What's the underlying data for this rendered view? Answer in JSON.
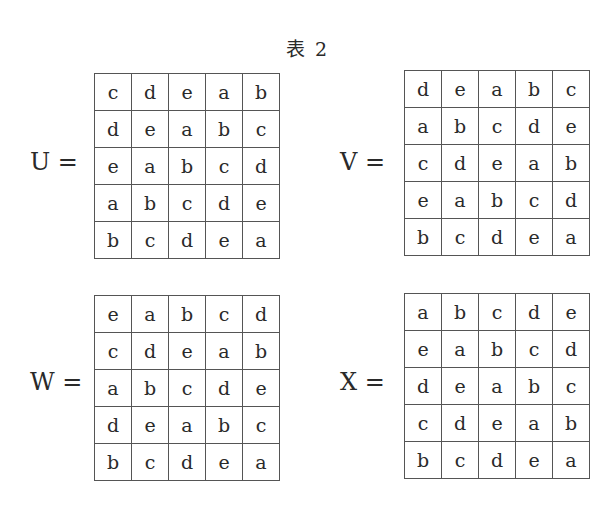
{
  "title": "表 2",
  "matrices": [
    {
      "name": "U",
      "label": "U =",
      "rows": [
        [
          "c",
          "d",
          "e",
          "a",
          "b"
        ],
        [
          "d",
          "e",
          "a",
          "b",
          "c"
        ],
        [
          "e",
          "a",
          "b",
          "c",
          "d"
        ],
        [
          "a",
          "b",
          "c",
          "d",
          "e"
        ],
        [
          "b",
          "c",
          "d",
          "e",
          "a"
        ]
      ]
    },
    {
      "name": "V",
      "label": "V =",
      "rows": [
        [
          "d",
          "e",
          "a",
          "b",
          "c"
        ],
        [
          "a",
          "b",
          "c",
          "d",
          "e"
        ],
        [
          "c",
          "d",
          "e",
          "a",
          "b"
        ],
        [
          "e",
          "a",
          "b",
          "c",
          "d"
        ],
        [
          "b",
          "c",
          "d",
          "e",
          "a"
        ]
      ]
    },
    {
      "name": "W",
      "label": "W =",
      "rows": [
        [
          "e",
          "a",
          "b",
          "c",
          "d"
        ],
        [
          "c",
          "d",
          "e",
          "a",
          "b"
        ],
        [
          "a",
          "b",
          "c",
          "d",
          "e"
        ],
        [
          "d",
          "e",
          "a",
          "b",
          "c"
        ],
        [
          "b",
          "c",
          "d",
          "e",
          "a"
        ]
      ]
    },
    {
      "name": "X",
      "label": "X =",
      "rows": [
        [
          "a",
          "b",
          "c",
          "d",
          "e"
        ],
        [
          "e",
          "a",
          "b",
          "c",
          "d"
        ],
        [
          "d",
          "e",
          "a",
          "b",
          "c"
        ],
        [
          "c",
          "d",
          "e",
          "a",
          "b"
        ],
        [
          "b",
          "c",
          "d",
          "e",
          "a"
        ]
      ]
    }
  ]
}
